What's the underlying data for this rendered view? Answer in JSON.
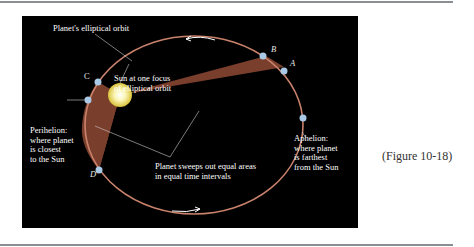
{
  "figure": {
    "reference": "(Figure 10-18)",
    "colors": {
      "background": "#000000",
      "orbit": "#c9826b",
      "swept_area": "#7a3e2c",
      "sun": "#f6f0a0",
      "planet_points": "#a9c9e6",
      "text": "#ffffff"
    },
    "labels": {
      "orbit": "Planet's elliptical orbit",
      "sun": "Sun at one focus\nof elliptical orbit",
      "perihelion": "Perihelion:\nwhere planet\nis closest\nto the Sun",
      "aphelion": "Aphelion:\nwhere planet\nis farthest\nfrom the Sun",
      "areas": "Planet sweeps out equal areas\nin equal time intervals"
    },
    "points": {
      "A": "A",
      "B": "B",
      "C": "C",
      "D": "D"
    }
  }
}
